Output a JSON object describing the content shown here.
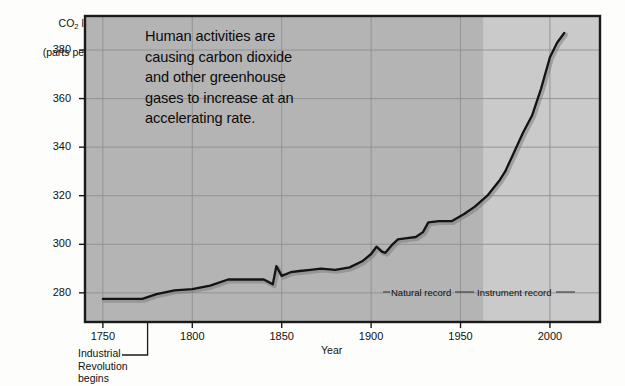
{
  "chart_data": {
    "type": "line",
    "title": "",
    "ylabel": "CO2 level (parts per million)",
    "ylabel_main": "CO",
    "ylabel_sub": "2",
    "ylabel_main_tail": " level",
    "ylabel_line2": "(parts per million)",
    "xlabel": "Year",
    "xlim": [
      1740,
      2028
    ],
    "ylim": [
      268,
      394
    ],
    "ytick_labels": [
      "380",
      "360",
      "340",
      "320",
      "300",
      "280"
    ],
    "ytick_values": [
      380,
      360,
      340,
      320,
      300,
      280
    ],
    "xtick_labels": [
      "1750",
      "1800",
      "1850",
      "1900",
      "1950",
      "2000"
    ],
    "xtick_values": [
      1750,
      1800,
      1850,
      1900,
      1950,
      2000
    ],
    "grid": true,
    "legend": "none",
    "series": [
      {
        "name": "Atmospheric CO2 concentration",
        "x": [
          1750,
          1760,
          1772,
          1780,
          1790,
          1800,
          1810,
          1820,
          1830,
          1840,
          1845,
          1847,
          1850,
          1855,
          1860,
          1866,
          1872,
          1880,
          1888,
          1895,
          1900,
          1903,
          1906,
          1908,
          1912,
          1915,
          1920,
          1925,
          1929,
          1932,
          1938,
          1945,
          1952,
          1958,
          1965,
          1972,
          1975,
          1980,
          1985,
          1990,
          1995,
          2000,
          2004,
          2008
        ],
        "values": [
          277.5,
          277.5,
          277.5,
          279.5,
          281.0,
          281.5,
          283.0,
          285.5,
          285.5,
          285.5,
          283.5,
          291.0,
          287.0,
          288.5,
          289.0,
          289.5,
          290.0,
          289.5,
          290.5,
          293.0,
          296.0,
          299.0,
          297.0,
          296.5,
          300.0,
          302.0,
          302.5,
          303.0,
          305.0,
          309.0,
          309.5,
          309.5,
          312.5,
          315.5,
          320.0,
          326.5,
          330.0,
          338.0,
          346.0,
          353.0,
          364.0,
          377.0,
          383.0,
          387.0
        ]
      }
    ],
    "regions": [
      {
        "name": "Natural record",
        "x_start": 1740,
        "x_end": 1963,
        "shade": "#b4b4b4"
      },
      {
        "name": "Instrument record",
        "x_start": 1963,
        "x_end": 2028,
        "shade": "#cacaca"
      }
    ],
    "annotations": [
      {
        "name": "main-callout",
        "lines": [
          "Human activities are",
          "causing carbon dioxide",
          "and other greenhouse",
          "gases to increase at an",
          "accelerating rate."
        ]
      },
      {
        "name": "industrial-revolution",
        "lines": [
          "Industrial",
          "Revolution",
          "begins"
        ],
        "points_to_year": 1775
      },
      {
        "name": "natural-record",
        "text": "Natural record"
      },
      {
        "name": "instrument-record",
        "text": "Instrument record"
      }
    ]
  },
  "colors": {
    "page_background": "#fdfdfb",
    "plot_background_natural": "#b4b4b4",
    "plot_background_instrument": "#cacaca",
    "line": "#141414",
    "grid": "#8e8e8e",
    "axis_border": "#1a1a1a",
    "text": "#111111"
  },
  "axis_title": {
    "y_line1_main": "CO",
    "y_line1_sub": "2",
    "y_line1_tail": " level",
    "y_line2": "(parts per million)",
    "x": "Year"
  }
}
